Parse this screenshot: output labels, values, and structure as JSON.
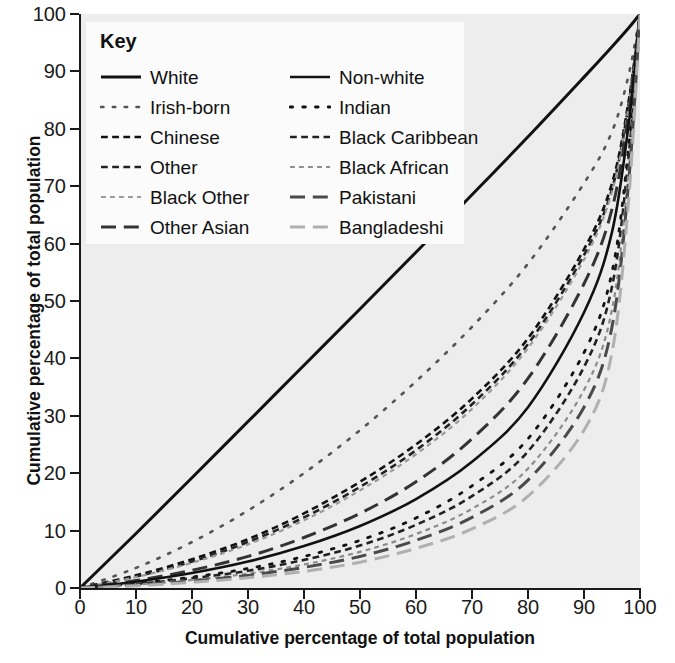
{
  "axes": {
    "x_title": "Cumulative percentage of total population",
    "y_title": "Cumulative percentage of total population",
    "x_ticks": [
      "0",
      "10",
      "20",
      "30",
      "40",
      "50",
      "60",
      "70",
      "80",
      "90",
      "100"
    ],
    "y_ticks": [
      "0",
      "10",
      "20",
      "30",
      "40",
      "50",
      "60",
      "70",
      "80",
      "90",
      "100"
    ]
  },
  "legend": {
    "title": "Key",
    "left_column": [
      {
        "label": "White",
        "style": "solid",
        "color": "#111111",
        "width": 3.0
      },
      {
        "label": "Irish-born",
        "style": "dotted",
        "color": "#555555",
        "width": 2.6
      },
      {
        "label": "Chinese",
        "style": "dashdot",
        "color": "#111111",
        "width": 2.6
      },
      {
        "label": "Other",
        "style": "dashdot",
        "color": "#222222",
        "width": 2.6
      },
      {
        "label": "Black Other",
        "style": "finedash",
        "color": "#9a9a9a",
        "width": 2.2
      },
      {
        "label": "Other Asian",
        "style": "dashed",
        "color": "#333333",
        "width": 3.0
      }
    ],
    "right_column": [
      {
        "label": "Non-white",
        "style": "solid",
        "color": "#111111",
        "width": 2.6
      },
      {
        "label": "Indian",
        "style": "dotted",
        "color": "#111111",
        "width": 2.8
      },
      {
        "label": "Black Caribbean",
        "style": "dashdot",
        "color": "#222222",
        "width": 2.6
      },
      {
        "label": "Black African",
        "style": "finedash",
        "color": "#8c8c8c",
        "width": 2.2
      },
      {
        "label": "Pakistani",
        "style": "dashed",
        "color": "#4a4a4a",
        "width": 3.0
      },
      {
        "label": "Bangladeshi",
        "style": "dashed",
        "color": "#b0b0b0",
        "width": 3.0
      }
    ]
  },
  "chart_data": {
    "type": "line",
    "title": "",
    "subtitle": "",
    "xlabel": "Cumulative percentage of total population",
    "ylabel": "Cumulative percentage of total population",
    "xlim": [
      0,
      100
    ],
    "ylim": [
      0,
      100
    ],
    "xticks": [
      0,
      10,
      20,
      30,
      40,
      50,
      60,
      70,
      80,
      90,
      100
    ],
    "yticks": [
      0,
      10,
      20,
      30,
      40,
      50,
      60,
      70,
      80,
      90,
      100
    ],
    "grid": false,
    "legend_position": "top-left-inset",
    "legend_title": "Key",
    "background": "#ededed",
    "x": [
      0,
      10,
      20,
      30,
      40,
      50,
      60,
      70,
      80,
      90,
      95,
      98,
      100
    ],
    "series": [
      {
        "name": "White",
        "style": "solid",
        "color": "#111111",
        "width": 3.0,
        "values": [
          0,
          9.5,
          19.2,
          29.0,
          38.8,
          48.6,
          58.5,
          68.5,
          78.6,
          89.0,
          94.3,
          97.6,
          100
        ]
      },
      {
        "name": "Irish-born",
        "style": "dotted",
        "color": "#555555",
        "width": 2.6,
        "values": [
          0,
          3.5,
          8.0,
          13.5,
          20.0,
          27.5,
          36.0,
          45.5,
          56.5,
          70.5,
          79.5,
          89.5,
          100
        ]
      },
      {
        "name": "Chinese",
        "style": "dashdot",
        "color": "#111111",
        "width": 2.6,
        "values": [
          0,
          2.2,
          5.0,
          8.5,
          13.0,
          18.5,
          25.0,
          33.0,
          43.5,
          59.0,
          70.5,
          85.0,
          100
        ]
      },
      {
        "name": "Other",
        "style": "dashdot",
        "color": "#222222",
        "width": 2.6,
        "values": [
          0,
          2.0,
          4.6,
          8.0,
          12.3,
          17.6,
          24.0,
          32.0,
          42.5,
          58.0,
          69.5,
          84.5,
          100
        ]
      },
      {
        "name": "Black Other",
        "style": "finedash",
        "color": "#9a9a9a",
        "width": 2.2,
        "values": [
          0,
          1.9,
          4.4,
          7.6,
          11.8,
          17.0,
          23.3,
          31.2,
          41.8,
          57.2,
          69.0,
          84.0,
          100
        ]
      },
      {
        "name": "Other Asian",
        "style": "dashed",
        "color": "#333333",
        "width": 3.0,
        "values": [
          0,
          1.3,
          3.1,
          5.5,
          8.8,
          13.0,
          18.5,
          26.0,
          36.5,
          53.0,
          66.0,
          83.0,
          100
        ]
      },
      {
        "name": "Non-white",
        "style": "solid",
        "color": "#111111",
        "width": 2.6,
        "values": [
          0,
          1.1,
          2.6,
          4.6,
          7.3,
          10.8,
          15.5,
          22.0,
          31.5,
          48.0,
          62.0,
          81.0,
          100
        ]
      },
      {
        "name": "Indian",
        "style": "dotted",
        "color": "#111111",
        "width": 2.8,
        "values": [
          0,
          0.8,
          1.9,
          3.4,
          5.5,
          8.3,
          12.2,
          17.8,
          26.0,
          41.0,
          55.0,
          77.0,
          100
        ]
      },
      {
        "name": "Black Caribbean",
        "style": "dashdot",
        "color": "#222222",
        "width": 2.6,
        "values": [
          0,
          0.7,
          1.7,
          3.0,
          4.9,
          7.4,
          11.0,
          16.0,
          23.8,
          38.5,
          52.5,
          75.5,
          100
        ]
      },
      {
        "name": "Black African",
        "style": "finedash",
        "color": "#8c8c8c",
        "width": 2.2,
        "values": [
          0,
          0.6,
          1.4,
          2.5,
          4.1,
          6.3,
          9.4,
          13.8,
          20.8,
          34.5,
          48.5,
          73.0,
          100
        ]
      },
      {
        "name": "Pakistani",
        "style": "dashed",
        "color": "#4a4a4a",
        "width": 3.0,
        "values": [
          0,
          0.5,
          1.2,
          2.2,
          3.6,
          5.5,
          8.3,
          12.3,
          18.8,
          31.5,
          45.5,
          71.0,
          100
        ]
      },
      {
        "name": "Bangladeshi",
        "style": "dashed",
        "color": "#b0b0b0",
        "width": 3.0,
        "values": [
          0,
          0.4,
          1.0,
          1.8,
          2.9,
          4.5,
          6.9,
          10.3,
          16.0,
          27.5,
          41.0,
          68.0,
          100
        ]
      }
    ]
  }
}
